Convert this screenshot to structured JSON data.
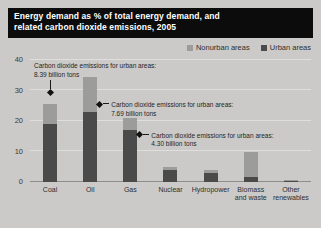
{
  "figure": {
    "title_line1": "Energy demand as % of total energy demand, and",
    "title_line2": "related carbon dioxide emissions, 2005",
    "source": "Source: IPCC 2007; IEA 2008."
  },
  "legend": {
    "items": [
      {
        "label": "Nonurban areas",
        "color": "#9c9c9a"
      },
      {
        "label": "Urban areas",
        "color": "#4a4a4a"
      }
    ]
  },
  "chart_data": {
    "type": "bar",
    "stacked": true,
    "title": "Energy demand as % of total energy demand, and related carbon dioxide emissions, 2005",
    "xlabel": "",
    "ylabel": "% of total energy demand",
    "ylim": [
      0,
      40
    ],
    "yticks": [
      0,
      10,
      20,
      30,
      40
    ],
    "grid": true,
    "legend_position": "top-right",
    "categories": [
      "Coal",
      "Oil",
      "Gas",
      "Nuclear",
      "Hydropower",
      "Biomass\nand waste",
      "Other\nrenewables"
    ],
    "series": [
      {
        "name": "Urban areas",
        "color": "#4a4a4a",
        "values": [
          19,
          23,
          17,
          4,
          3,
          1.5,
          0.2
        ]
      },
      {
        "name": "Nonurban areas",
        "color": "#9c9c9a",
        "values": [
          6.5,
          11.5,
          4,
          1,
          1,
          8.2,
          0.3
        ]
      }
    ],
    "annotations": [
      {
        "category": "Coal",
        "label": "Carbon dioxide emissions for urban areas:",
        "value_label": "8.39 billion tons",
        "marker_value": 30
      },
      {
        "category": "Oil",
        "label": "Carbon dioxide emissions for urban areas:",
        "value_label": "7.69 billion tons",
        "marker_value": 25.5
      },
      {
        "category": "Gas",
        "label": "Carbon dioxide emissions for urban areas:",
        "value_label": "4.30 billion tons",
        "marker_value": 15.5
      }
    ]
  }
}
